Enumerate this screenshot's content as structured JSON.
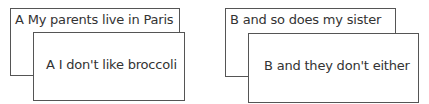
{
  "cards": {
    "a_back": {
      "text": "A My parents live in Paris"
    },
    "a_front": {
      "text": "A I don't like broccoli"
    },
    "b_back": {
      "text": "B and so does my sister"
    },
    "b_front": {
      "text": "B and they don't either"
    }
  },
  "colors": {
    "border": "#555555",
    "text": "#333333",
    "background": "#ffffff"
  }
}
